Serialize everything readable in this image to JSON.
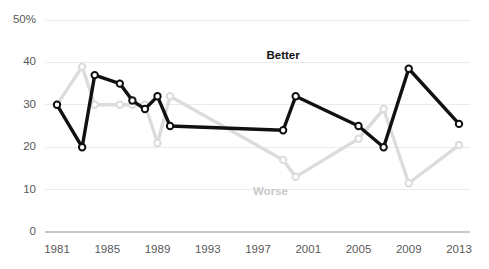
{
  "chart_data": {
    "type": "line",
    "title": "",
    "subtitle": "",
    "xlabel": "",
    "ylabel": "",
    "xlim": [
      1981,
      2013
    ],
    "ylim": [
      0,
      50
    ],
    "grid": true,
    "legend_position": "inline-annotation",
    "y_ticks": [
      0,
      10,
      20,
      30,
      40,
      50
    ],
    "y_tick_labels": [
      "0",
      "10",
      "20",
      "30",
      "40",
      "50%"
    ],
    "x_ticks": [
      1981,
      1985,
      1989,
      1993,
      1997,
      2001,
      2005,
      2009,
      2013
    ],
    "x_tick_labels": [
      "1981",
      "1985",
      "1989",
      "1993",
      "1997",
      "2001",
      "2005",
      "2009",
      "2013"
    ],
    "series": [
      {
        "name": "Better",
        "color": "#111111",
        "label_color": "#111111",
        "label_x": 1999,
        "label_y": 41.5,
        "x": [
          1981,
          1983,
          1984,
          1986,
          1987,
          1988,
          1989,
          1990,
          1999,
          2000,
          2005,
          2007,
          2009,
          2013
        ],
        "values": [
          30,
          20,
          37,
          35,
          31,
          29,
          32,
          25,
          24,
          32,
          25,
          20,
          38.5,
          25.5
        ]
      },
      {
        "name": "Worse",
        "color": "#dcdcdc",
        "label_color": "#c9c9c9",
        "label_x": 1998,
        "label_y": 9.5,
        "x": [
          1981,
          1983,
          1984,
          1986,
          1987,
          1988,
          1989,
          1990,
          1999,
          2000,
          2005,
          2007,
          2009,
          2013
        ],
        "values": [
          30,
          39,
          30,
          30,
          30,
          30,
          21,
          32,
          17,
          13,
          22,
          29,
          11.5,
          20.5
        ]
      }
    ]
  },
  "axis_colors": {
    "gridline": "#ebebeb",
    "axis_line": "#c8c8c8",
    "tick_text": "#58585a"
  }
}
